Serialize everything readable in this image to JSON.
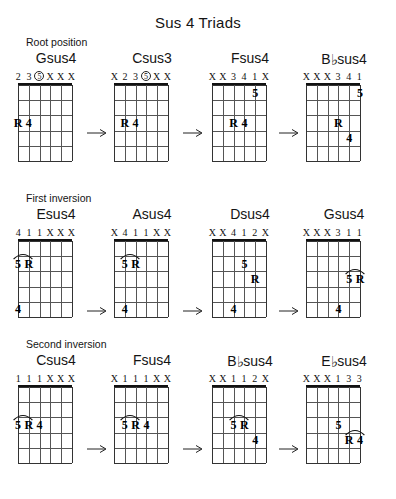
{
  "title": "Sus 4 Triads",
  "sections": [
    {
      "label": "Root position"
    },
    {
      "label": "First inversion"
    },
    {
      "label": "Second inversion"
    }
  ],
  "arrow_glyph": "→",
  "diagram": {
    "strings": 6,
    "frets": 5,
    "muted_marker": "X"
  },
  "rows": [
    {
      "name": "root-position",
      "section_label": "Root position",
      "chords": [
        {
          "name": "Gsus4",
          "accidental": "",
          "fingering": [
            "2",
            "3",
            "5",
            "X",
            "X",
            "X"
          ],
          "circled": [
            2
          ],
          "notes": [
            {
              "text": "R",
              "string": 1,
              "fret": 3
            },
            {
              "text": "4",
              "string": 2,
              "fret": 3
            }
          ],
          "slurs": []
        },
        {
          "name": "Csus3",
          "accidental": "",
          "fingering": [
            "X",
            "2",
            "3",
            "5",
            "X",
            "X"
          ],
          "circled": [
            3
          ],
          "notes": [
            {
              "text": "R",
              "string": 2,
              "fret": 3
            },
            {
              "text": "4",
              "string": 3,
              "fret": 3
            }
          ],
          "slurs": []
        },
        {
          "name": "Fsus4",
          "accidental": "",
          "fingering": [
            "X",
            "X",
            "3",
            "4",
            "1",
            "X"
          ],
          "circled": [],
          "notes": [
            {
              "text": "5",
              "string": 5,
              "fret": 1
            },
            {
              "text": "R",
              "string": 3,
              "fret": 3
            },
            {
              "text": "4",
              "string": 4,
              "fret": 3
            }
          ],
          "slurs": []
        },
        {
          "name": "Bsus4",
          "accidental": "♭",
          "fingering": [
            "X",
            "X",
            "X",
            "3",
            "4",
            "1"
          ],
          "circled": [],
          "notes": [
            {
              "text": "5",
              "string": 6,
              "fret": 1
            },
            {
              "text": "R",
              "string": 4,
              "fret": 3
            },
            {
              "text": "4",
              "string": 5,
              "fret": 4
            }
          ],
          "slurs": []
        }
      ]
    },
    {
      "name": "first-inversion",
      "section_label": "First inversion",
      "chords": [
        {
          "name": "Esus4",
          "accidental": "",
          "fingering": [
            "4",
            "1",
            "1",
            "X",
            "X",
            "X"
          ],
          "circled": [],
          "notes": [
            {
              "text": "5",
              "string": 1,
              "fret": 2
            },
            {
              "text": "R",
              "string": 2,
              "fret": 2
            },
            {
              "text": "4",
              "string": 1,
              "fret": 5
            }
          ],
          "slurs": [
            {
              "string_start": 1,
              "string_end": 2,
              "fret": 2
            }
          ]
        },
        {
          "name": "Asus4",
          "accidental": "",
          "fingering": [
            "X",
            "4",
            "1",
            "1",
            "X",
            "X"
          ],
          "circled": [],
          "notes": [
            {
              "text": "5",
              "string": 2,
              "fret": 2
            },
            {
              "text": "R",
              "string": 3,
              "fret": 2
            },
            {
              "text": "4",
              "string": 2,
              "fret": 5
            }
          ],
          "slurs": [
            {
              "string_start": 2,
              "string_end": 3,
              "fret": 2
            }
          ]
        },
        {
          "name": "Dsus4",
          "accidental": "",
          "fingering": [
            "X",
            "X",
            "4",
            "1",
            "2",
            "X"
          ],
          "circled": [],
          "notes": [
            {
              "text": "5",
              "string": 4,
              "fret": 2
            },
            {
              "text": "R",
              "string": 5,
              "fret": 3
            },
            {
              "text": "4",
              "string": 3,
              "fret": 5
            }
          ],
          "slurs": []
        },
        {
          "name": "Gsus4",
          "accidental": "",
          "fingering": [
            "X",
            "X",
            "X",
            "3",
            "1",
            "1"
          ],
          "circled": [],
          "notes": [
            {
              "text": "5",
              "string": 5,
              "fret": 3
            },
            {
              "text": "R",
              "string": 6,
              "fret": 3
            },
            {
              "text": "4",
              "string": 4,
              "fret": 5
            }
          ],
          "slurs": [
            {
              "string_start": 5,
              "string_end": 6,
              "fret": 3
            }
          ]
        }
      ]
    },
    {
      "name": "second-inversion",
      "section_label": "Second inversion",
      "chords": [
        {
          "name": "Csus4",
          "accidental": "",
          "fingering": [
            "1",
            "1",
            "1",
            "X",
            "X",
            "X"
          ],
          "circled": [],
          "notes": [
            {
              "text": "5",
              "string": 1,
              "fret": 3
            },
            {
              "text": "R",
              "string": 2,
              "fret": 3
            },
            {
              "text": "4",
              "string": 3,
              "fret": 3
            }
          ],
          "slurs": [
            {
              "string_start": 1,
              "string_end": 2,
              "fret": 3
            }
          ]
        },
        {
          "name": "Fsus4",
          "accidental": "",
          "fingering": [
            "X",
            "1",
            "1",
            "1",
            "X",
            "X"
          ],
          "circled": [],
          "notes": [
            {
              "text": "5",
              "string": 2,
              "fret": 3
            },
            {
              "text": "R",
              "string": 3,
              "fret": 3
            },
            {
              "text": "4",
              "string": 4,
              "fret": 3
            }
          ],
          "slurs": [
            {
              "string_start": 2,
              "string_end": 3,
              "fret": 3
            }
          ]
        },
        {
          "name": "Bsus4",
          "accidental": "♭",
          "fingering": [
            "X",
            "X",
            "1",
            "1",
            "2",
            "X"
          ],
          "circled": [],
          "notes": [
            {
              "text": "5",
              "string": 3,
              "fret": 3
            },
            {
              "text": "R",
              "string": 4,
              "fret": 3
            },
            {
              "text": "4",
              "string": 5,
              "fret": 4
            }
          ],
          "slurs": [
            {
              "string_start": 3,
              "string_end": 4,
              "fret": 3
            }
          ]
        },
        {
          "name": "Esus4",
          "accidental": "♭",
          "fingering": [
            "X",
            "X",
            "X",
            "1",
            "3",
            "3"
          ],
          "circled": [],
          "notes": [
            {
              "text": "5",
              "string": 4,
              "fret": 3
            },
            {
              "text": "R",
              "string": 5,
              "fret": 4
            },
            {
              "text": "4",
              "string": 6,
              "fret": 4
            }
          ],
          "slurs": [
            {
              "string_start": 5,
              "string_end": 6,
              "fret": 4
            }
          ]
        }
      ]
    }
  ],
  "layout": {
    "row_tops": [
      50,
      206,
      352
    ],
    "chord_lefts": [
      14,
      110,
      208,
      302
    ],
    "arrow_lefts": [
      86,
      182,
      278
    ],
    "arrow_row_offsets": [
      78,
      100,
      92
    ]
  }
}
